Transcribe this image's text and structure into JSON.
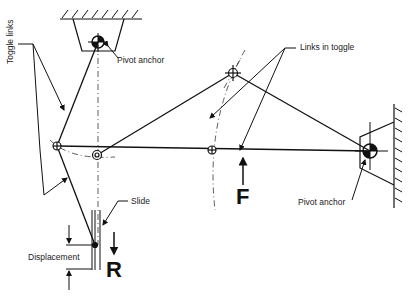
{
  "diagram": {
    "type": "mechanism-schematic",
    "labels": {
      "toggle_links": "Toggle links",
      "pivot_anchor_top": "Pivot anchor",
      "links_in_toggle": "Links in toggle",
      "pivot_anchor_right": "Pivot anchor",
      "slide": "Slide",
      "displacement": "Displacement",
      "force_input": "F",
      "force_output": "R"
    },
    "colors": {
      "ink": "#111111",
      "background": "#ffffff"
    }
  }
}
